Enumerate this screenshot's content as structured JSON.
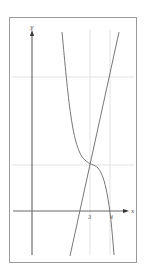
{
  "figure": {
    "axes": {
      "x_label": "x",
      "y_label": "y",
      "x_ticks": [
        "3",
        "4"
      ]
    },
    "colors": {
      "frame": "#9a9a9a",
      "axis": "#555555",
      "curve": "#777777",
      "guide": "#dcdcdc"
    },
    "curves": [
      {
        "name": "cubic-curve",
        "description": "decreasing cubic with horizontal inflection at x=3, crossing x-axis at x=4"
      },
      {
        "name": "tangent-line",
        "description": "line through inflection point at x=3 with positive slope"
      }
    ]
  }
}
